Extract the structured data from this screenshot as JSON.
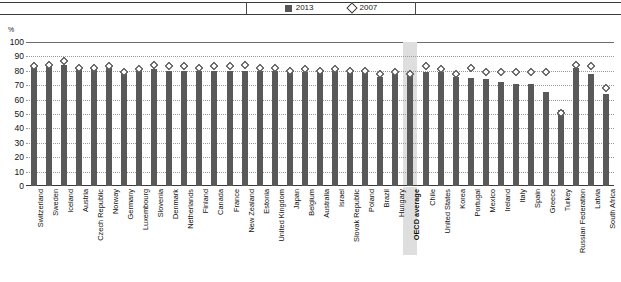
{
  "legend": {
    "items": [
      {
        "label": "2013",
        "marker": "filled-square-icon",
        "color": "#595959"
      },
      {
        "label": "2007",
        "marker": "open-diamond-icon",
        "color": "#ffffff"
      }
    ]
  },
  "axis": {
    "unit": "%",
    "yticks": [
      "100",
      "90",
      "80",
      "70",
      "60",
      "50",
      "40",
      "30",
      "20",
      "10",
      "0"
    ]
  },
  "highlight": {
    "category": "OECD average",
    "color": "#dedede"
  },
  "chart_data": {
    "type": "bar",
    "title": "",
    "xlabel": "",
    "ylabel": "%",
    "ylim": [
      0,
      100
    ],
    "ytick_step": 10,
    "grid": true,
    "legend_position": "top-center",
    "categories": [
      "Switzerland",
      "Sweden",
      "Iceland",
      "Austria",
      "Czech Republic",
      "Norway",
      "Germany",
      "Luxembourg",
      "Slovenia",
      "Denmark",
      "Netherlands",
      "Finland",
      "Canada",
      "France",
      "New Zealand",
      "Estonia",
      "United Kingdom",
      "Japan",
      "Belgium",
      "Australia",
      "Israel",
      "Slovak Republic",
      "Poland",
      "Brazil",
      "Hungary",
      "OECD average",
      "Chile",
      "United States",
      "Korea",
      "Portugal",
      "Mexico",
      "Ireland",
      "Italy",
      "Spain",
      "Greece",
      "Turkey",
      "Russian Federation",
      "Latvia",
      "South Africa"
    ],
    "series": [
      {
        "name": "2013",
        "marker": "bar",
        "values": [
          83,
          83,
          84,
          81,
          81,
          82,
          78,
          80,
          81,
          80,
          80,
          80,
          80,
          80,
          80,
          80,
          80,
          79,
          79,
          79,
          80,
          79,
          79,
          76,
          78,
          77,
          79,
          79,
          76,
          75,
          74,
          72,
          71,
          71,
          65,
          53,
          82,
          78,
          64
        ]
      },
      {
        "name": "2007",
        "marker": "diamond",
        "values": [
          83,
          84,
          87,
          82,
          82,
          83,
          79,
          81,
          84,
          83,
          83,
          82,
          83,
          83,
          84,
          82,
          82,
          80,
          81,
          80,
          81,
          80,
          80,
          78,
          79,
          78,
          83,
          81,
          78,
          82,
          79,
          79,
          79,
          79,
          79,
          51,
          84,
          83,
          68
        ]
      }
    ]
  }
}
